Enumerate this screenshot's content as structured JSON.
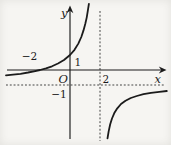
{
  "figure": {
    "background": "#f6f5f2",
    "ink": "#1b1b1b",
    "dash_color": "#3a3a3a",
    "labels": {
      "y_axis": "y",
      "x_axis": "x",
      "origin": "O",
      "y_intercept_tick": "1",
      "x_intercept_tick": "−2",
      "vertical_asymptote_tick": "2",
      "horizontal_asymptote_tick": "−1"
    }
  },
  "chart_data": {
    "type": "line",
    "title": "",
    "xlabel": "x",
    "ylabel": "y",
    "origin_label": "O",
    "x_ticks": [
      -2,
      2
    ],
    "y_ticks": [
      1,
      -1
    ],
    "xlim": [
      -4.3,
      6.5
    ],
    "ylim": [
      -4.7,
      4.5
    ],
    "grid": false,
    "legend": "none",
    "asymptotes": {
      "vertical_x": 2,
      "horizontal_y": -1
    },
    "intercepts": {
      "x_intercept": [
        -2,
        0
      ],
      "y_intercept": [
        0,
        1
      ]
    },
    "series": [
      {
        "name": "left-branch",
        "points": [
          [
            -4.27,
            -0.36
          ],
          [
            -3.8,
            -0.31
          ],
          [
            -3.3,
            -0.25
          ],
          [
            -2.8,
            -0.17
          ],
          [
            -2.4,
            -0.09
          ],
          [
            -2,
            0
          ],
          [
            -1.6,
            0.11
          ],
          [
            -1.2,
            0.25
          ],
          [
            -0.8,
            0.43
          ],
          [
            -0.4,
            0.67
          ],
          [
            0,
            1
          ],
          [
            0.3,
            1.35
          ],
          [
            0.55,
            1.76
          ],
          [
            0.75,
            2.2
          ],
          [
            0.9,
            2.64
          ],
          [
            1.02,
            3.08
          ],
          [
            1.11,
            3.49
          ],
          [
            1.19,
            3.94
          ],
          [
            1.26,
            4.41
          ]
        ]
      },
      {
        "name": "right-branch",
        "points": [
          [
            2.5,
            -4.56
          ],
          [
            2.58,
            -4.07
          ],
          [
            2.68,
            -3.62
          ],
          [
            2.8,
            -3.23
          ],
          [
            2.95,
            -2.87
          ],
          [
            3.15,
            -2.55
          ],
          [
            3.4,
            -2.27
          ],
          [
            3.7,
            -2.05
          ],
          [
            4.05,
            -1.87
          ],
          [
            4.45,
            -1.73
          ],
          [
            4.9,
            -1.61
          ],
          [
            5.4,
            -1.52
          ],
          [
            5.95,
            -1.45
          ],
          [
            6.45,
            -1.4
          ]
        ]
      }
    ]
  }
}
